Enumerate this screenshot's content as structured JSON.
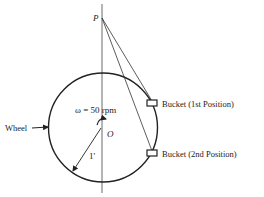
{
  "diagram": {
    "point_label": "P",
    "center_label": "O",
    "angular_velocity": "ω = 50 rpm",
    "radius_label": "1'",
    "wheel_label": "Wheel",
    "bucket1_label": "Bucket (1st Position)",
    "bucket2_label": "Bucket (2nd Position)",
    "colors": {
      "ink": "#222222",
      "background": "#ffffff"
    }
  }
}
